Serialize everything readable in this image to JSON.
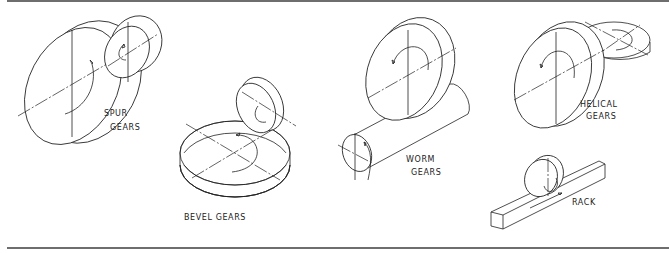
{
  "figure": {
    "labels": {
      "spur_line1": "SPUR",
      "spur_line2": "GEARS",
      "bevel": "BEVEL GEARS",
      "worm_line1": "WORM",
      "worm_line2": "GEARS",
      "helical_line1": "HELICAL",
      "helical_line2": "GEARS",
      "rack": "RACK"
    },
    "line_color": "#222222",
    "rule_color": "#6e6e6e"
  }
}
